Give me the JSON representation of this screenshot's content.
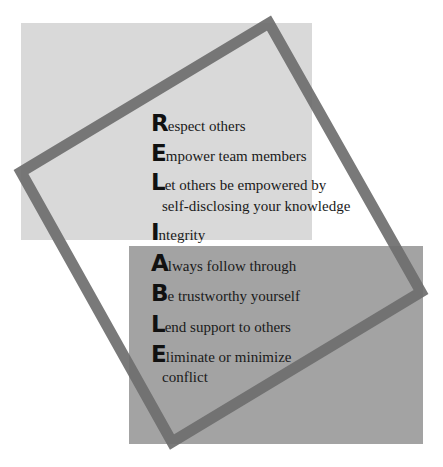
{
  "colors": {
    "background": "#ffffff",
    "light_panel": "#d9d9d9",
    "dark_panel": "#a3a3a3",
    "frame": "#6e6e6e",
    "text": "#1a1a1a"
  },
  "acronym": "RELIABLE",
  "items": [
    {
      "initial": "R",
      "rest": "espect others"
    },
    {
      "initial": "E",
      "rest": "mpower team members"
    },
    {
      "initial": "L",
      "rest": "et others be empowered by",
      "continuation": "self-disclosing your knowledge"
    },
    {
      "initial": "I",
      "rest": "ntegrity"
    },
    {
      "initial": "A",
      "rest": "lways follow through"
    },
    {
      "initial": "B",
      "rest": "e trustworthy yourself"
    },
    {
      "initial": "L",
      "rest": "end support to others"
    },
    {
      "initial": "E",
      "rest": "liminate or minimize",
      "continuation": "conflict"
    }
  ]
}
